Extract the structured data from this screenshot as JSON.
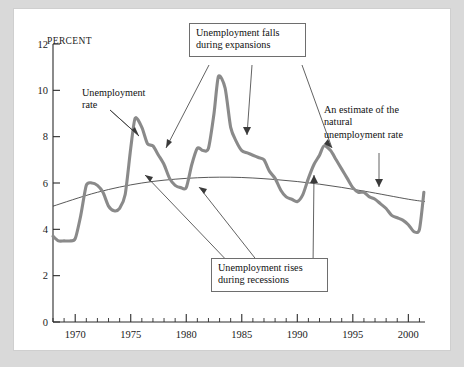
{
  "figure": {
    "y_axis_title": "Percent",
    "background_color": "#d9d9d9",
    "panel_color": "#ffffff",
    "series_color": "#8a8a8a",
    "natural_rate_color": "#3a3a3a"
  },
  "annotations": {
    "unemployment_rate": "Unemployment\nrate",
    "falls_expansions": "Unemployment falls\nduring expansions",
    "rises_recessions": "Unemployment rises\nduring recessions",
    "natural_rate": "An estimate of the\nnatural\nunemployment rate"
  },
  "chart_data": {
    "type": "line",
    "title": "",
    "xlabel": "",
    "ylabel": "Percent",
    "xlim": [
      1968,
      2001.5
    ],
    "ylim": [
      0,
      12
    ],
    "yticks": [
      0,
      2,
      4,
      6,
      8,
      10,
      12
    ],
    "ytick_labels": [
      "0",
      "2",
      "4",
      "6",
      "8",
      "10",
      "12"
    ],
    "xticks": [
      1970,
      1975,
      1980,
      1985,
      1990,
      1995,
      2000
    ],
    "xtick_labels": [
      "1970",
      "1975",
      "1980",
      "1985",
      "1990",
      "1995",
      "2000"
    ],
    "x_minor_tick_interval": 1,
    "grid": false,
    "legend": "none",
    "series": [
      {
        "name": "Unemployment rate",
        "x": [
          1968.0,
          1968.5,
          1969.0,
          1969.5,
          1970.0,
          1970.5,
          1971.0,
          1971.5,
          1972.0,
          1972.5,
          1973.0,
          1973.5,
          1974.0,
          1974.5,
          1975.0,
          1975.4,
          1976.0,
          1976.5,
          1977.0,
          1977.5,
          1978.0,
          1978.5,
          1979.0,
          1979.5,
          1980.0,
          1980.5,
          1981.0,
          1981.5,
          1982.0,
          1982.5,
          1982.9,
          1983.5,
          1984.0,
          1984.5,
          1985.0,
          1985.5,
          1986.0,
          1986.5,
          1987.0,
          1987.5,
          1988.0,
          1988.5,
          1989.0,
          1989.5,
          1990.0,
          1990.5,
          1991.0,
          1991.5,
          1992.0,
          1992.4,
          1993.0,
          1993.5,
          1994.0,
          1994.5,
          1995.0,
          1995.5,
          1996.0,
          1996.5,
          1997.0,
          1997.5,
          1998.0,
          1998.5,
          1999.0,
          1999.5,
          2000.0,
          2000.5,
          2001.0,
          2001.4
        ],
        "y": [
          3.7,
          3.5,
          3.5,
          3.5,
          3.6,
          4.6,
          5.9,
          6.0,
          5.9,
          5.6,
          5.0,
          4.8,
          4.9,
          5.5,
          7.5,
          8.8,
          8.4,
          7.7,
          7.6,
          7.2,
          6.8,
          6.2,
          5.9,
          5.8,
          5.8,
          6.8,
          7.5,
          7.4,
          7.5,
          9.0,
          10.6,
          10.1,
          8.4,
          7.8,
          7.4,
          7.3,
          7.2,
          7.1,
          7.0,
          6.5,
          6.2,
          5.7,
          5.4,
          5.3,
          5.2,
          5.5,
          6.2,
          6.8,
          7.2,
          7.6,
          7.4,
          7.0,
          6.6,
          6.2,
          5.8,
          5.6,
          5.6,
          5.4,
          5.3,
          5.1,
          4.9,
          4.6,
          4.5,
          4.4,
          4.2,
          3.9,
          4.0,
          5.6
        ],
        "style": "thick-gray"
      },
      {
        "name": "An estimate of the natural unemployment rate",
        "x": [
          1968,
          1972,
          1976,
          1980,
          1984,
          1988,
          1992,
          1996,
          2000,
          2001.5
        ],
        "y": [
          5.0,
          5.6,
          6.0,
          6.2,
          6.25,
          6.15,
          5.95,
          5.65,
          5.3,
          5.2
        ],
        "style": "thin-black"
      }
    ]
  }
}
